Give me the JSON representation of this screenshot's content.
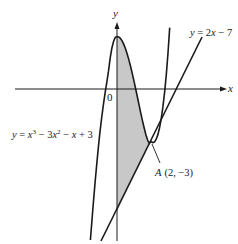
{
  "diagram": {
    "title": "",
    "axes": {
      "x_label": "x",
      "y_label": "y",
      "origin_label": "0"
    },
    "curves": [
      {
        "name": "cubic",
        "equation": "y = x^3 - 3x^2 - x + 3",
        "label_parts": {
          "y": "y",
          "eq": " = ",
          "x3": "x",
          "e3": "3",
          "m1": " − 3",
          "x2": "x",
          "e2": "2",
          "m2": " − ",
          "x1": "x",
          "p": " + 3"
        }
      },
      {
        "name": "line",
        "equation": "y = 2x - 7",
        "label_parts": {
          "y": "y",
          "eq": " = 2",
          "x": "x",
          "rest": " − 7"
        }
      }
    ],
    "point": {
      "name": "A",
      "coords": "(2, −3)",
      "x": 2,
      "y": -3
    },
    "shaded_region": "between curve and line from x = 0 to x = 2",
    "colors": {
      "line": "#1a1a1a",
      "shade": "#c8c8c8",
      "background": "#ffffff"
    }
  }
}
